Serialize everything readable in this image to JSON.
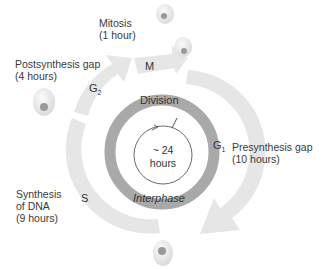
{
  "diagram": {
    "center": {
      "line1": "~ 24",
      "line2": "hours"
    },
    "inner_ring": {
      "top_label": "Division",
      "bottom_label": "Interphase"
    },
    "phases": [
      {
        "id": "M",
        "symbol": "M",
        "sub": "",
        "name": "Mitosis",
        "duration": "(1 hour)"
      },
      {
        "id": "G1",
        "symbol": "G",
        "sub": "1",
        "name": "Presynthesis gap",
        "duration": "(10 hours)"
      },
      {
        "id": "S",
        "symbol": "S",
        "sub": "",
        "name_line1": "Synthesis",
        "name_line2": "of DNA",
        "duration": "(9 hours)"
      },
      {
        "id": "G2",
        "symbol": "G",
        "sub": "2",
        "name": "Postsynthesis gap",
        "duration": "(4 hours)"
      }
    ],
    "colors": {
      "outer_arrow": "#e6e6e6",
      "inner_ring": "#a9a9a9",
      "text": "#3a3a3a",
      "cell": "#ececec",
      "nucleus": "#9a9a9a"
    }
  }
}
